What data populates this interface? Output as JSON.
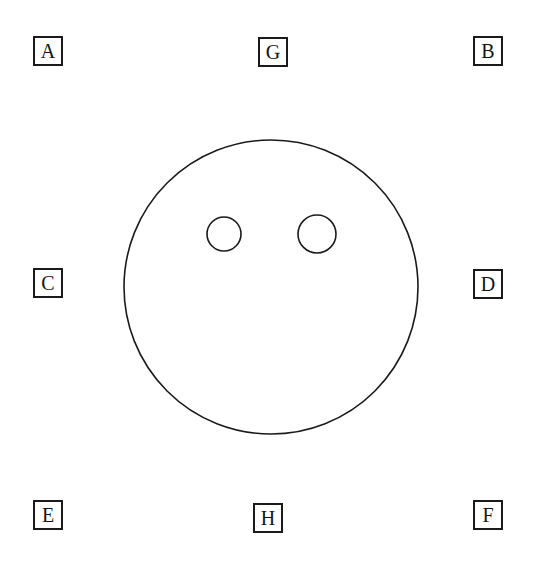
{
  "figure": {
    "background_color": "#ffffff",
    "stroke_color": "#1a1a1a",
    "text_color": "#141414",
    "canvas": {
      "width": 546,
      "height": 574
    },
    "shapes": {
      "main_circle": {
        "name": "large-circle",
        "cx": 271,
        "cy": 287,
        "r": 147,
        "stroke_width": 1.6,
        "fill": "none"
      },
      "small_circles": [
        {
          "name": "small-circle-left",
          "cx": 224,
          "cy": 234,
          "r": 17,
          "stroke_width": 1.6,
          "fill": "none"
        },
        {
          "name": "small-circle-right",
          "cx": 317,
          "cy": 234,
          "r": 19,
          "stroke_width": 1.6,
          "fill": "none"
        }
      ]
    },
    "markers": [
      {
        "id": "marker-a",
        "label": "A",
        "x": 33,
        "y": 36,
        "size": 30,
        "position": "top-left"
      },
      {
        "id": "marker-g",
        "label": "G",
        "x": 258,
        "y": 37,
        "size": 30,
        "position": "top-center"
      },
      {
        "id": "marker-b",
        "label": "B",
        "x": 473,
        "y": 36,
        "size": 30,
        "position": "top-right"
      },
      {
        "id": "marker-c",
        "label": "C",
        "x": 33,
        "y": 268,
        "size": 30,
        "position": "middle-left"
      },
      {
        "id": "marker-d",
        "label": "D",
        "x": 473,
        "y": 269,
        "size": 30,
        "position": "middle-right"
      },
      {
        "id": "marker-e",
        "label": "E",
        "x": 33,
        "y": 500,
        "size": 30,
        "position": "bottom-left"
      },
      {
        "id": "marker-h",
        "label": "H",
        "x": 253,
        "y": 503,
        "size": 30,
        "position": "bottom-center"
      },
      {
        "id": "marker-f",
        "label": "F",
        "x": 473,
        "y": 500,
        "size": 30,
        "position": "bottom-right"
      }
    ]
  }
}
